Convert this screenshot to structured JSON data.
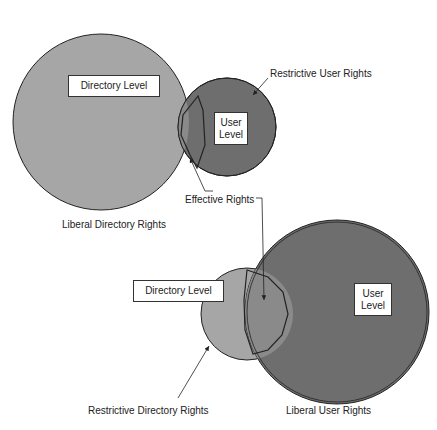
{
  "colors": {
    "directory_fill": "#a6a6a6",
    "user_fill": "#6e6e6e",
    "overlap_fill": "#8a8a8a",
    "outline": "#222222",
    "background": "#ffffff"
  },
  "top_diagram": {
    "directory_box": "Directory Level",
    "user_box_line1": "User",
    "user_box_line2": "Level",
    "label_restrictive_user": "Restrictive User Rights",
    "label_effective": "Effective Rights",
    "label_liberal_directory": "Liberal Directory Rights"
  },
  "bottom_diagram": {
    "directory_box": "Directory Level",
    "user_box_line1": "User",
    "user_box_line2": "Level",
    "label_restrictive_directory": "Restrictive Directory Rights",
    "label_liberal_user": "Liberal User Rights"
  }
}
